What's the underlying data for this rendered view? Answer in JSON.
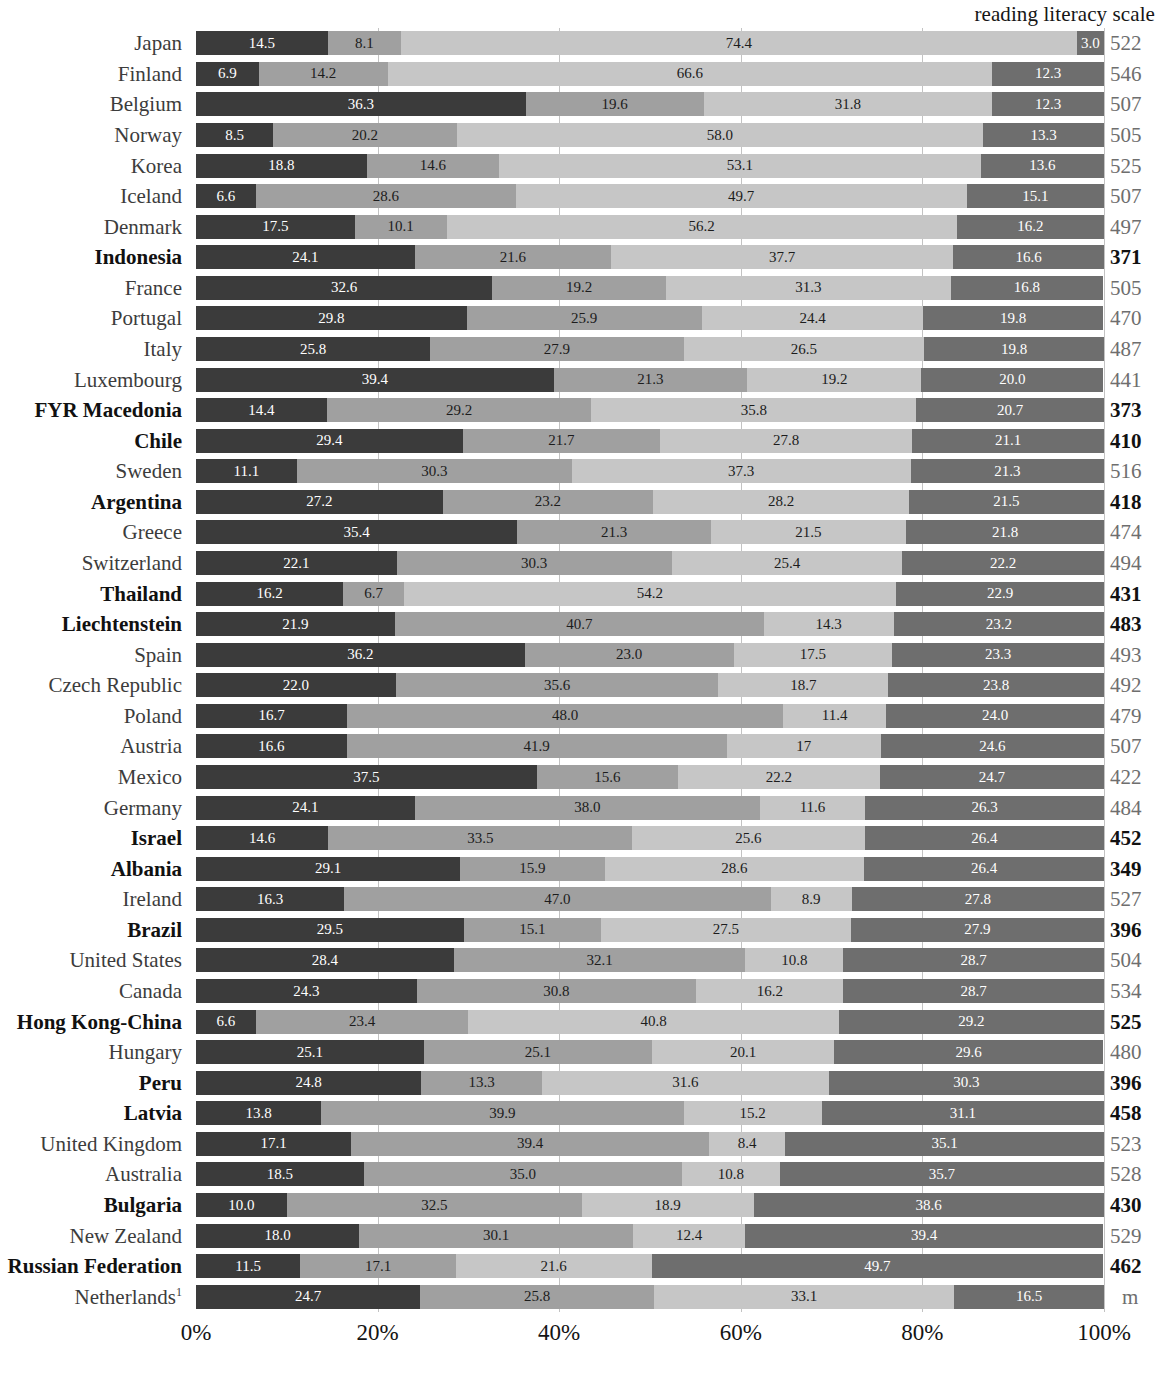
{
  "header": {
    "scale_title": "reading literacy scale"
  },
  "axis": {
    "ticks": [
      "0%",
      "20%",
      "40%",
      "60%",
      "80%",
      "100%"
    ],
    "tick_values": [
      0,
      20,
      40,
      60,
      80,
      100
    ],
    "xmin": 0,
    "xmax": 100
  },
  "colors": {
    "segment_1": "#3b3b3b",
    "segment_2": "#a0a0a0",
    "segment_3": "#c6c6c6",
    "segment_4": "#6e6e6e",
    "gridline": "#b9b9b9",
    "label": "#3c3c3c",
    "label_highlight": "#111111",
    "scale_value": "#6e6e6e"
  },
  "chart_data": {
    "type": "bar",
    "orientation": "horizontal",
    "stacked": true,
    "title": "",
    "xlabel": "",
    "ylabel": "",
    "xlim": [
      0,
      100
    ],
    "grid": true,
    "legend_position": "none",
    "value_column_header": "reading literacy scale",
    "categories": [
      "Japan",
      "Finland",
      "Belgium",
      "Norway",
      "Korea",
      "Iceland",
      "Denmark",
      "Indonesia",
      "France",
      "Portugal",
      "Italy",
      "Luxembourg",
      "FYR Macedonia",
      "Chile",
      "Sweden",
      "Argentina",
      "Greece",
      "Switzerland",
      "Thailand",
      "Liechtenstein",
      "Spain",
      "Czech Republic",
      "Poland",
      "Austria",
      "Mexico",
      "Germany",
      "Israel",
      "Albania",
      "Ireland",
      "Brazil",
      "United States",
      "Canada",
      "Hong Kong-China",
      "Hungary",
      "Peru",
      "Latvia",
      "United Kingdom",
      "Australia",
      "Bulgaria",
      "New Zealand",
      "Russian Federation",
      "Netherlands"
    ],
    "series": [
      {
        "name": "segment-1",
        "values": [
          14.5,
          6.9,
          36.3,
          8.5,
          18.8,
          6.6,
          17.5,
          24.1,
          32.6,
          29.8,
          25.8,
          39.4,
          14.4,
          29.4,
          11.1,
          27.2,
          35.4,
          22.1,
          16.2,
          21.9,
          36.2,
          22.0,
          16.7,
          16.6,
          37.5,
          24.1,
          14.6,
          29.1,
          16.3,
          29.5,
          28.4,
          24.3,
          6.6,
          25.1,
          24.8,
          13.8,
          17.1,
          18.5,
          10.0,
          18.0,
          11.5,
          24.7
        ]
      },
      {
        "name": "segment-2",
        "values": [
          8.1,
          14.2,
          19.6,
          20.2,
          14.6,
          28.6,
          10.1,
          21.6,
          19.2,
          25.9,
          27.9,
          21.3,
          29.2,
          21.7,
          30.3,
          23.2,
          21.3,
          30.3,
          6.7,
          40.7,
          23.0,
          35.6,
          48.0,
          41.9,
          15.6,
          38.0,
          33.5,
          15.9,
          47.0,
          15.1,
          32.1,
          30.8,
          23.4,
          25.1,
          13.3,
          39.9,
          39.4,
          35.0,
          32.5,
          30.1,
          17.1,
          25.8
        ]
      },
      {
        "name": "segment-3",
        "values": [
          74.4,
          66.6,
          31.8,
          58.0,
          53.1,
          49.7,
          56.2,
          37.7,
          31.3,
          24.4,
          26.5,
          19.2,
          35.8,
          27.8,
          37.3,
          28.2,
          21.5,
          25.4,
          54.2,
          14.3,
          17.5,
          18.7,
          11.4,
          17.0,
          22.2,
          11.6,
          25.6,
          28.6,
          8.9,
          27.5,
          10.8,
          16.2,
          40.8,
          20.1,
          31.6,
          15.2,
          8.4,
          10.8,
          18.9,
          12.4,
          21.6,
          33.1
        ]
      },
      {
        "name": "segment-4",
        "values": [
          3.0,
          12.3,
          12.3,
          13.3,
          13.6,
          15.1,
          16.2,
          16.6,
          16.8,
          19.8,
          19.8,
          20.0,
          20.7,
          21.1,
          21.3,
          21.5,
          21.8,
          22.2,
          22.9,
          23.2,
          23.3,
          23.8,
          24.0,
          24.6,
          24.7,
          26.3,
          26.4,
          26.4,
          27.8,
          27.9,
          28.7,
          28.7,
          29.2,
          29.6,
          30.3,
          31.1,
          35.1,
          35.7,
          38.6,
          39.4,
          49.7,
          16.5
        ]
      }
    ],
    "segment_labels": [
      [
        "14.5",
        "8.1",
        "74.4",
        "3.0"
      ],
      [
        "6.9",
        "14.2",
        "66.6",
        "12.3"
      ],
      [
        "36.3",
        "19.6",
        "31.8",
        "12.3"
      ],
      [
        "8.5",
        "20.2",
        "58.0",
        "13.3"
      ],
      [
        "18.8",
        "14.6",
        "53.1",
        "13.6"
      ],
      [
        "6.6",
        "28.6",
        "49.7",
        "15.1"
      ],
      [
        "17.5",
        "10.1",
        "56.2",
        "16.2"
      ],
      [
        "24.1",
        "21.6",
        "37.7",
        "16.6"
      ],
      [
        "32.6",
        "19.2",
        "31.3",
        "16.8"
      ],
      [
        "29.8",
        "25.9",
        "24.4",
        "19.8"
      ],
      [
        "25.8",
        "27.9",
        "26.5",
        "19.8"
      ],
      [
        "39.4",
        "21.3",
        "19.2",
        "20.0"
      ],
      [
        "14.4",
        "29.2",
        "35.8",
        "20.7"
      ],
      [
        "29.4",
        "21.7",
        "27.8",
        "21.1"
      ],
      [
        "11.1",
        "30.3",
        "37.3",
        "21.3"
      ],
      [
        "27.2",
        "23.2",
        "28.2",
        "21.5"
      ],
      [
        "35.4",
        "21.3",
        "21.5",
        "21.8"
      ],
      [
        "22.1",
        "30.3",
        "25.4",
        "22.2"
      ],
      [
        "16.2",
        "6.7",
        "54.2",
        "22.9"
      ],
      [
        "21.9",
        "40.7",
        "14.3",
        "23.2"
      ],
      [
        "36.2",
        "23.0",
        "17.5",
        "23.3"
      ],
      [
        "22.0",
        "35.6",
        "18.7",
        "23.8"
      ],
      [
        "16.7",
        "48.0",
        "11.4",
        "24.0"
      ],
      [
        "16.6",
        "41.9",
        "17",
        "24.6"
      ],
      [
        "37.5",
        "15.6",
        "22.2",
        "24.7"
      ],
      [
        "24.1",
        "38.0",
        "11.6",
        "26.3"
      ],
      [
        "14.6",
        "33.5",
        "25.6",
        "26.4"
      ],
      [
        "29.1",
        "15.9",
        "28.6",
        "26.4"
      ],
      [
        "16.3",
        "47.0",
        "8.9",
        "27.8"
      ],
      [
        "29.5",
        "15.1",
        "27.5",
        "27.9"
      ],
      [
        "28.4",
        "32.1",
        "10.8",
        "28.7"
      ],
      [
        "24.3",
        "30.8",
        "16.2",
        "28.7"
      ],
      [
        "6.6",
        "23.4",
        "40.8",
        "29.2"
      ],
      [
        "25.1",
        "25.1",
        "20.1",
        "29.6"
      ],
      [
        "24.8",
        "13.3",
        "31.6",
        "30.3"
      ],
      [
        "13.8",
        "39.9",
        "15.2",
        "31.1"
      ],
      [
        "17.1",
        "39.4",
        "8.4",
        "35.1"
      ],
      [
        "18.5",
        "35.0",
        "10.8",
        "35.7"
      ],
      [
        "10.0",
        "32.5",
        "18.9",
        "38.6"
      ],
      [
        "18.0",
        "30.1",
        "12.4",
        "39.4"
      ],
      [
        "11.5",
        "17.1",
        "21.6",
        "49.7"
      ],
      [
        "24.7",
        "25.8",
        "33.1",
        "16.5"
      ]
    ],
    "reading_literacy_scale": [
      "522",
      "546",
      "507",
      "505",
      "525",
      "507",
      "497",
      "371",
      "505",
      "470",
      "487",
      "441",
      "373",
      "410",
      "516",
      "418",
      "474",
      "494",
      "431",
      "483",
      "493",
      "492",
      "479",
      "507",
      "422",
      "484",
      "452",
      "349",
      "527",
      "396",
      "504",
      "534",
      "525",
      "480",
      "396",
      "458",
      "523",
      "528",
      "430",
      "529",
      "462",
      "m"
    ],
    "highlighted_rows": [
      false,
      false,
      false,
      false,
      false,
      false,
      false,
      true,
      false,
      false,
      false,
      false,
      true,
      true,
      false,
      true,
      false,
      false,
      true,
      true,
      false,
      false,
      false,
      false,
      false,
      false,
      true,
      true,
      false,
      true,
      false,
      false,
      true,
      false,
      true,
      true,
      false,
      false,
      true,
      false,
      true,
      false
    ],
    "footnote_marks": {
      "41": "1"
    }
  }
}
